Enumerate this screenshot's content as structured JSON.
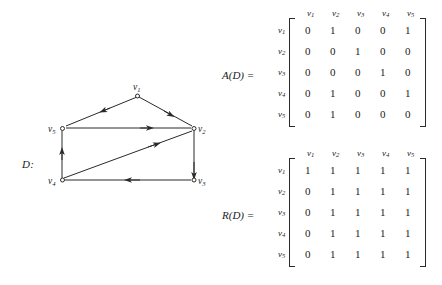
{
  "figure": {
    "graph_label": "D:",
    "vertices": [
      {
        "id": "v1",
        "label": "v",
        "sub": "1",
        "x": 137,
        "y": 94
      },
      {
        "id": "v2",
        "label": "v",
        "sub": "2",
        "x": 194,
        "y": 128
      },
      {
        "id": "v3",
        "label": "v",
        "sub": "3",
        "x": 194,
        "y": 180
      },
      {
        "id": "v4",
        "label": "v",
        "sub": "4",
        "x": 62,
        "y": 180
      },
      {
        "id": "v5",
        "label": "v",
        "sub": "5",
        "x": 62,
        "y": 128
      }
    ],
    "edges": [
      {
        "from": "v1",
        "to": "v5"
      },
      {
        "from": "v1",
        "to": "v2"
      },
      {
        "from": "v5",
        "to": "v2"
      },
      {
        "from": "v2",
        "to": "v3"
      },
      {
        "from": "v3",
        "to": "v4"
      },
      {
        "from": "v4",
        "to": "v5"
      },
      {
        "from": "v4",
        "to": "v2"
      }
    ]
  },
  "matrix_a": {
    "name": "A(D)  =",
    "col_headers": [
      {
        "label": "v",
        "sub": "1"
      },
      {
        "label": "v",
        "sub": "2"
      },
      {
        "label": "v",
        "sub": "3"
      },
      {
        "label": "v",
        "sub": "4"
      },
      {
        "label": "v",
        "sub": "5"
      }
    ],
    "row_headers": [
      {
        "label": "v",
        "sub": "1"
      },
      {
        "label": "v",
        "sub": "2"
      },
      {
        "label": "v",
        "sub": "3"
      },
      {
        "label": "v",
        "sub": "4"
      },
      {
        "label": "v",
        "sub": "5"
      }
    ],
    "rows": [
      [
        "0",
        "1",
        "0",
        "0",
        "1"
      ],
      [
        "0",
        "0",
        "1",
        "0",
        "0"
      ],
      [
        "0",
        "0",
        "0",
        "1",
        "0"
      ],
      [
        "0",
        "1",
        "0",
        "0",
        "1"
      ],
      [
        "0",
        "1",
        "0",
        "0",
        "0"
      ]
    ]
  },
  "matrix_r": {
    "name": "R(D)  =",
    "col_headers": [
      {
        "label": "v",
        "sub": "1"
      },
      {
        "label": "v",
        "sub": "2"
      },
      {
        "label": "v",
        "sub": "3"
      },
      {
        "label": "v",
        "sub": "4"
      },
      {
        "label": "v",
        "sub": "5"
      }
    ],
    "row_headers": [
      {
        "label": "v",
        "sub": "1"
      },
      {
        "label": "v",
        "sub": "2"
      },
      {
        "label": "v",
        "sub": "3"
      },
      {
        "label": "v",
        "sub": "4"
      },
      {
        "label": "v",
        "sub": "5"
      }
    ],
    "rows": [
      [
        "1",
        "1",
        "1",
        "1",
        "1"
      ],
      [
        "0",
        "1",
        "1",
        "1",
        "1"
      ],
      [
        "0",
        "1",
        "1",
        "1",
        "1"
      ],
      [
        "0",
        "1",
        "1",
        "1",
        "1"
      ],
      [
        "0",
        "1",
        "1",
        "1",
        "1"
      ]
    ]
  },
  "colors": {
    "ink": "#1a1a1a",
    "stroke": "#2a2a2a",
    "background": "#ffffff"
  }
}
